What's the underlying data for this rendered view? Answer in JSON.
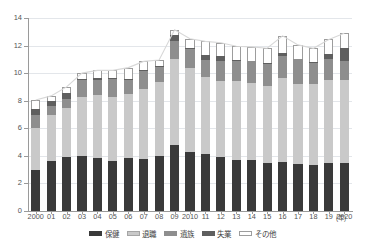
{
  "chart_data": {
    "type": "bar",
    "stacked": true,
    "title": "",
    "xlabel": "年",
    "ylabel": "",
    "ylim": [
      0,
      14
    ],
    "yticks": [
      0,
      2,
      4,
      6,
      8,
      10,
      12,
      14
    ],
    "grid": true,
    "legend_position": "bottom",
    "categories": [
      "2000",
      "01",
      "02",
      "03",
      "04",
      "05",
      "06",
      "07",
      "08",
      "09",
      "2010",
      "11",
      "12",
      "13",
      "14",
      "15",
      "16",
      "17",
      "18",
      "19",
      "2020"
    ],
    "series": [
      {
        "name": "保健",
        "color": "#3a3a3a",
        "values": [
          3.0,
          3.6,
          3.9,
          4.0,
          3.85,
          3.6,
          3.85,
          3.75,
          4.0,
          4.8,
          4.3,
          4.1,
          3.9,
          3.7,
          3.7,
          3.5,
          3.55,
          3.4,
          3.35,
          3.5,
          3.5
        ]
      },
      {
        "name": "退職",
        "color": "#c9c9c9",
        "values": [
          3.05,
          3.35,
          3.6,
          4.3,
          4.55,
          4.65,
          4.65,
          5.1,
          5.35,
          6.2,
          6.1,
          5.6,
          5.55,
          5.7,
          5.6,
          5.6,
          6.1,
          5.85,
          5.85,
          6.0,
          6.0
        ]
      },
      {
        "name": "遺族",
        "color": "#8e8e8e",
        "values": [
          0.9,
          0.7,
          0.6,
          1.2,
          1.1,
          1.35,
          1.0,
          1.3,
          1.1,
          1.35,
          1.35,
          1.25,
          1.4,
          1.5,
          1.55,
          1.6,
          1.6,
          1.75,
          1.55,
          1.5,
          1.4
        ]
      },
      {
        "name": "失業",
        "color": "#5f5f5f",
        "values": [
          0.45,
          0.35,
          0.45,
          0.1,
          0.15,
          0.05,
          0.1,
          0.1,
          0.1,
          0.45,
          0.05,
          0.35,
          0.4,
          0.05,
          0.05,
          0.05,
          0.25,
          0.0,
          0.05,
          0.4,
          0.9
        ]
      },
      {
        "name": "その他",
        "color": "#ffffff",
        "values": [
          0.65,
          0.35,
          0.45,
          0.4,
          0.55,
          0.55,
          0.8,
          0.6,
          0.4,
          0.35,
          0.7,
          1.0,
          0.95,
          1.0,
          1.0,
          1.05,
          1.2,
          1.05,
          1.0,
          1.05,
          1.1
        ]
      }
    ],
    "totals": [
      8.05,
      8.35,
      9.0,
      10.0,
      10.2,
      10.2,
      10.4,
      10.85,
      10.95,
      13.15,
      12.5,
      12.3,
      12.2,
      11.95,
      11.9,
      11.8,
      12.7,
      12.05,
      11.8,
      12.45,
      12.9
    ],
    "trend_line": {
      "visible": true,
      "color": "#d8d8d8",
      "description": "faint line tracing the stacked bar totals"
    }
  },
  "axis": {
    "y_ticks": [
      "14",
      "12",
      "10",
      "8",
      "6",
      "4",
      "2",
      "0"
    ],
    "x_ticks": [
      "2000",
      "01",
      "02",
      "03",
      "04",
      "05",
      "06",
      "07",
      "08",
      "09",
      "2010",
      "11",
      "12",
      "13",
      "14",
      "15",
      "16",
      "17",
      "18",
      "19",
      "2020"
    ],
    "x_unit": "(年)"
  },
  "legend": {
    "items": [
      {
        "label": "保健",
        "swatch": "swatch-hoken"
      },
      {
        "label": "退職",
        "swatch": "swatch-taishoku"
      },
      {
        "label": "遺族",
        "swatch": "swatch-izoku"
      },
      {
        "label": "失業",
        "swatch": "swatch-shitsugyo"
      },
      {
        "label": "その他",
        "swatch": "swatch-sonota"
      }
    ]
  },
  "footer": {
    "source_note": ""
  },
  "colors": {
    "hoken": "#3a3a3a",
    "taishoku": "#c9c9c9",
    "izoku": "#8e8e8e",
    "shitsugyo": "#5f5f5f",
    "sonota": "#ffffff",
    "grid": "#e3e6ea",
    "axis": "#9a9a9a"
  }
}
